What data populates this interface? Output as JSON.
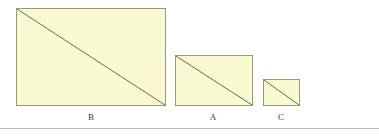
{
  "figure": {
    "canvas": {
      "width": 379,
      "height": 140,
      "background": "#ffffff"
    },
    "style": {
      "fill_color": "#fafad2",
      "border_color": "#9a9a7a",
      "diagonal_color": "#6b6b4a",
      "label_color": "#3a3a3a",
      "rule_color": "#b8b8c2"
    },
    "baseline_rule": {
      "x": 0,
      "y": 128,
      "width": 379
    },
    "rectangles": [
      {
        "label": "B",
        "x": 16,
        "y": 8,
        "width": 150,
        "height": 98,
        "label_x": 68,
        "label_y": 112,
        "label_width": 46
      },
      {
        "label": "A",
        "x": 175,
        "y": 55,
        "width": 78,
        "height": 51,
        "label_x": 190,
        "label_y": 112,
        "label_width": 46
      },
      {
        "label": "C",
        "x": 263,
        "y": 79,
        "width": 37,
        "height": 27,
        "label_x": 258,
        "label_y": 112,
        "label_width": 46
      }
    ]
  },
  "chart_data": {
    "type": "bar",
    "title": "",
    "xlabel": "",
    "ylabel": "",
    "categories": [
      "B",
      "A",
      "C"
    ],
    "values": [
      150,
      78,
      37
    ],
    "series": [
      {
        "name": "width",
        "values": [
          150,
          78,
          37
        ]
      },
      {
        "name": "height",
        "values": [
          98,
          51,
          27
        ]
      }
    ],
    "annotations": [
      "B",
      "A",
      "C"
    ],
    "legend": "none",
    "grid": false
  }
}
